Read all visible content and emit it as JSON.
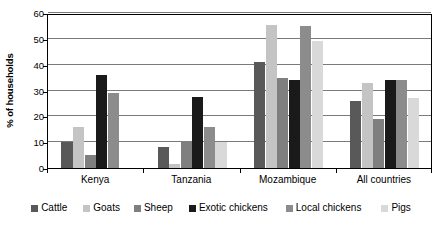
{
  "chart_data": {
    "type": "bar",
    "title": "",
    "subtitle": "",
    "xlabel": "",
    "ylabel": "% of households",
    "ylim": [
      0,
      60
    ],
    "yticks": [
      0,
      10,
      20,
      30,
      40,
      50,
      60
    ],
    "ytick_labels": [
      "0",
      "10",
      "20",
      "30",
      "40",
      "50",
      "60"
    ],
    "grid": "horizontal",
    "legend_position": "bottom",
    "categories": [
      "Kenya",
      "Tanzania",
      "Mozambique",
      "All countries"
    ],
    "series": [
      {
        "name": "Cattle",
        "color": "#595959",
        "values": [
          10,
          8,
          41,
          26
        ]
      },
      {
        "name": "Goats",
        "color": "#c4c4c4",
        "values": [
          16,
          1.5,
          55.5,
          33
        ]
      },
      {
        "name": "Sheep",
        "color": "#7f7f7f",
        "values": [
          5,
          10.5,
          35,
          19
        ]
      },
      {
        "name": "Exotic chickens",
        "color": "#1a1a1a",
        "values": [
          36,
          27.5,
          34,
          34
        ]
      },
      {
        "name": "Local chickens",
        "color": "#8c8c8c",
        "values": [
          29,
          16,
          55,
          34
        ]
      },
      {
        "name": "Pigs",
        "color": "#d9d9d9",
        "values": [
          0,
          10,
          49,
          27
        ]
      }
    ]
  }
}
